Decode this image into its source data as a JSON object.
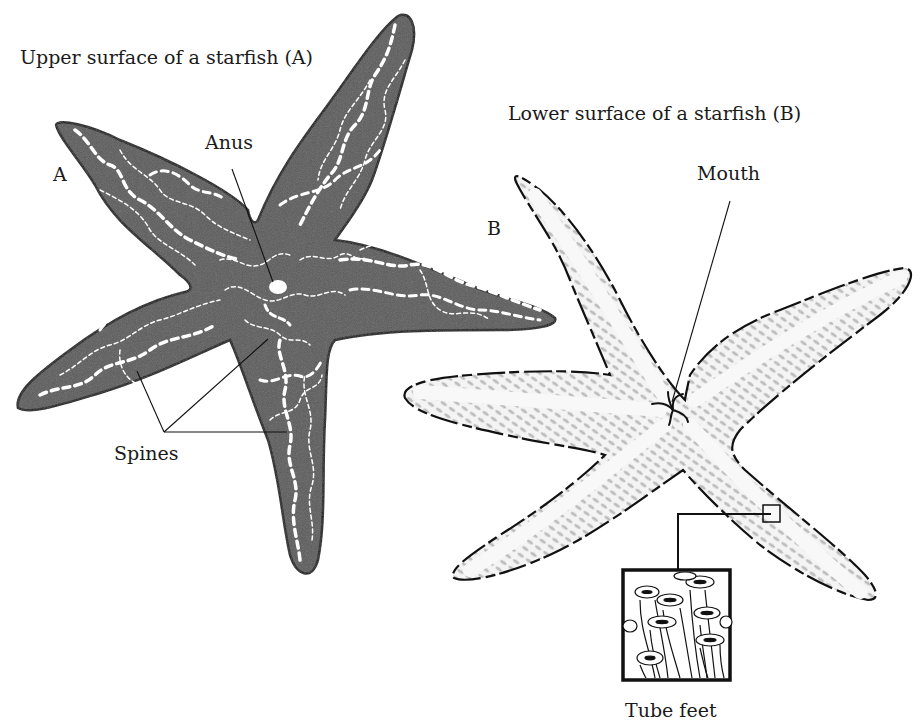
{
  "diagram": {
    "title_a": "Upper surface of a starfish (A)",
    "title_b": "Lower surface of a starfish (B)",
    "marker_a": "A",
    "marker_b": "B",
    "labels": {
      "anus": "Anus",
      "spines": "Spines",
      "mouth": "Mouth",
      "tube_feet": "Tube feet"
    },
    "colors": {
      "upper_fill": "#5a5a5a",
      "upper_pattern": "#ffffff",
      "lower_fill": "#f2f2f2",
      "lower_pattern": "#bdbdbd",
      "outline": "#111111",
      "background": "#ffffff"
    }
  }
}
